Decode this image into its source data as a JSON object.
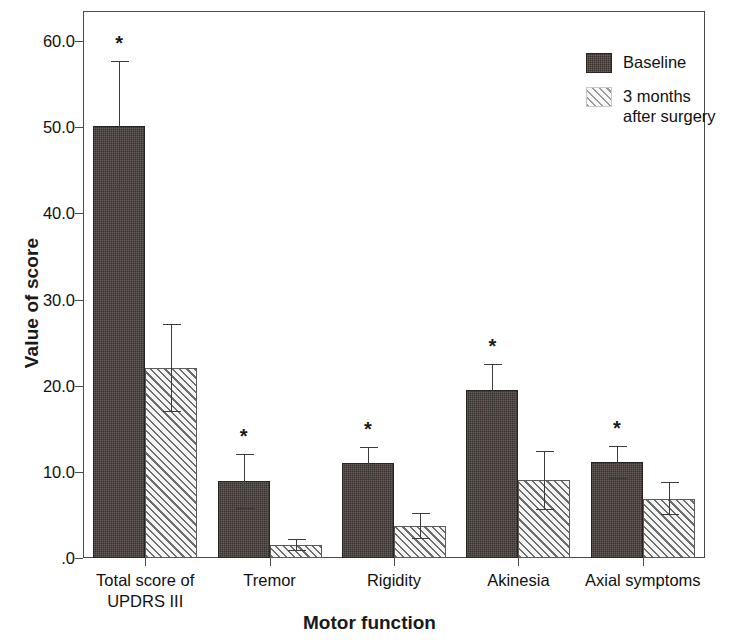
{
  "chart_data": {
    "type": "bar",
    "title": "",
    "xlabel": "Motor function",
    "ylabel": "Value of score",
    "categories": [
      "Total score of\nUPDRS III",
      "Tremor",
      "Rigidity",
      "Akinesia",
      "Axial symptoms"
    ],
    "ytick_labels": [
      ".0",
      "10.0",
      "20.0",
      "30.0",
      "40.0",
      "50.0",
      "60.0"
    ],
    "ytick_values": [
      0,
      10,
      20,
      30,
      40,
      50,
      60
    ],
    "ylim": [
      0,
      63.5
    ],
    "grid": false,
    "legend_position": "top-right",
    "series": [
      {
        "name": "Baseline",
        "fill": "dark-solid",
        "color": "#3a312d",
        "values": [
          50.2,
          8.9,
          11.0,
          19.5,
          11.1
        ],
        "errors": [
          7.5,
          3.2,
          1.9,
          3.0,
          1.9
        ],
        "significant": [
          true,
          true,
          true,
          true,
          true
        ]
      },
      {
        "name": "3 months\nafter surgery",
        "fill": "diagonal-hatch",
        "color": "#f2f2f2",
        "values": [
          22.1,
          1.5,
          3.7,
          9.0,
          6.9
        ],
        "errors": [
          5.1,
          0.7,
          1.5,
          3.4,
          1.9
        ],
        "significant": [
          false,
          false,
          false,
          false,
          false
        ]
      }
    ],
    "annotations": [
      {
        "text": "*",
        "meaning": "significant difference vs 3 months after surgery"
      }
    ]
  },
  "legend": {
    "items": [
      {
        "label": "Baseline"
      },
      {
        "label": "3 months\nafter surgery"
      }
    ]
  },
  "axes": {
    "y_title": "Value of score",
    "x_title": "Motor function"
  }
}
